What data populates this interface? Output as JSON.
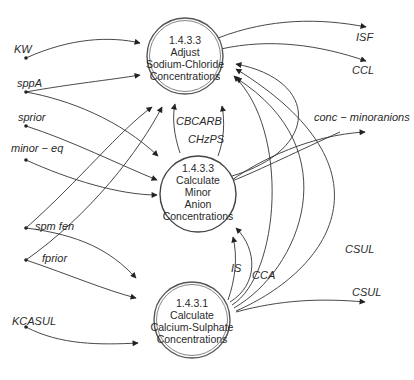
{
  "processes": {
    "adjust": {
      "id": "1.4.3.3",
      "line1": "Adjust",
      "line2": "Sodium-Chloride",
      "line3": "Concentrations"
    },
    "minor": {
      "id": "1.4.3.3",
      "line1": "Calculate",
      "line2": "Minor",
      "line3": "Anion",
      "line4": "Concentrations"
    },
    "calcium": {
      "id": "1.4.3.1",
      "line1": "Calculate",
      "line2": "Calcium-Sulphate",
      "line3": "Concentrations"
    }
  },
  "inputs": [
    "KW",
    "sppA",
    "sprior",
    "minor − eq",
    "spm fen",
    "fprior",
    "KCASUL"
  ],
  "outputs": [
    "ISF",
    "CCL",
    "conc − minoranions",
    "CSUL"
  ],
  "internal_flows": [
    "CBCARB",
    "CHzPS",
    "IS",
    "CCA",
    "CSUL"
  ],
  "labels": {
    "kw": "KW",
    "sppa": "sppA",
    "sprior": "sprior",
    "minor_eq": "minor − eq",
    "spm_fen": "spm fen",
    "fprior": "fprior",
    "kcasul": "KCASUL",
    "isf": "ISF",
    "ccl": "CCL",
    "conc_minor": "conc − minoranions",
    "csul_out": "CSUL",
    "csul_mid": "CSUL",
    "cbcarb": "CBCARB",
    "chzps": "CHzPS",
    "is": "IS",
    "cca": "CCA"
  }
}
